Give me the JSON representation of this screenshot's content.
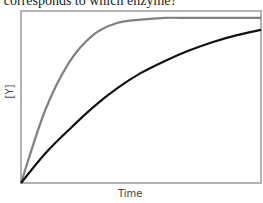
{
  "question": {
    "text": "e corresponds to which enzyme?"
  },
  "chart_data": {
    "type": "line",
    "title": "",
    "xlabel": "Time",
    "ylabel": "[Y]",
    "grid": false,
    "legend": null,
    "x_ticks": [],
    "y_ticks": [],
    "x": [
      0,
      0.1,
      0.2,
      0.3,
      0.4,
      0.5,
      0.6,
      0.7,
      0.8,
      0.9,
      1.0
    ],
    "series": [
      {
        "name": "gray curve (fast, saturating)",
        "color": "#808080",
        "values": [
          0,
          0.42,
          0.7,
          0.86,
          0.93,
          0.95,
          0.96,
          0.96,
          0.96,
          0.96,
          0.96
        ]
      },
      {
        "name": "black curve (slow)",
        "color": "#111111",
        "values": [
          0,
          0.17,
          0.31,
          0.44,
          0.55,
          0.64,
          0.71,
          0.77,
          0.82,
          0.86,
          0.89
        ]
      }
    ],
    "xlim": [
      0,
      1
    ],
    "ylim": [
      0,
      1
    ]
  },
  "colors": {
    "axis": "#7a7a7a",
    "gray_curve": "#808080",
    "black_curve": "#111111"
  }
}
